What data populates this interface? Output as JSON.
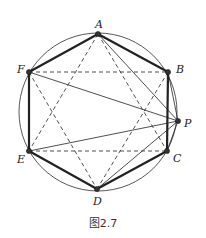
{
  "figure": {
    "caption": "图2.7",
    "circle": {
      "cx": 98,
      "cy": 112,
      "r": 79
    },
    "points": {
      "A": {
        "x": 98,
        "y": 34,
        "label": "A",
        "lx": 95,
        "ly": 28
      },
      "B": {
        "x": 168,
        "y": 72,
        "label": "B",
        "lx": 176,
        "ly": 73
      },
      "C": {
        "x": 167,
        "y": 151,
        "label": "C",
        "lx": 173,
        "ly": 162
      },
      "D": {
        "x": 97,
        "y": 189,
        "label": "D",
        "lx": 93,
        "ly": 205
      },
      "E": {
        "x": 29,
        "y": 151,
        "label": "E",
        "lx": 17,
        "ly": 163
      },
      "F": {
        "x": 29,
        "y": 72,
        "label": "F",
        "lx": 17,
        "ly": 73
      },
      "P": {
        "x": 178,
        "y": 121,
        "label": "P",
        "lx": 184,
        "ly": 127
      }
    },
    "hexagon_edges": [
      [
        "A",
        "B"
      ],
      [
        "B",
        "C"
      ],
      [
        "C",
        "D"
      ],
      [
        "D",
        "E"
      ],
      [
        "E",
        "F"
      ],
      [
        "F",
        "A"
      ]
    ],
    "dashed_segments": [
      [
        "F",
        "B"
      ],
      [
        "E",
        "C"
      ],
      [
        "A",
        "E"
      ],
      [
        "A",
        "C"
      ],
      [
        "F",
        "D"
      ],
      [
        "B",
        "D"
      ]
    ],
    "p_segments": [
      [
        "P",
        "A"
      ],
      [
        "P",
        "B"
      ],
      [
        "P",
        "C"
      ],
      [
        "P",
        "D"
      ],
      [
        "P",
        "E"
      ],
      [
        "P",
        "F"
      ]
    ],
    "colors": {
      "stroke": "#222222",
      "circle": "#444444"
    }
  }
}
